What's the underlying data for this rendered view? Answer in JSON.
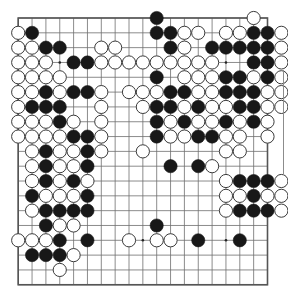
{
  "board": {
    "title": "Go game position",
    "size": 19,
    "geometry": {
      "left": 18.2,
      "top": 18.0,
      "spacing_x": 13.85,
      "spacing_y": 14.82,
      "stone_radius": 6.6,
      "border_width": 1.6,
      "line_width": 0.8
    },
    "colors": {
      "background": "#ffffff",
      "line": "#6f6f6f",
      "border": "#555555",
      "black_stone": "#181818",
      "white_stone": "#ffffff",
      "white_stone_outline": "#3a3a3a",
      "star_point": "#222222",
      "artifact_line": "#9a9a9a"
    },
    "star_points": [
      [
        3,
        3
      ],
      [
        9,
        3
      ],
      [
        15,
        3
      ],
      [
        3,
        9
      ],
      [
        9,
        9
      ],
      [
        15,
        9
      ],
      [
        3,
        15
      ],
      [
        9,
        15
      ],
      [
        15,
        15
      ]
    ],
    "column_labels": [
      "A",
      "B",
      "C",
      "D",
      "E",
      "F",
      "G",
      "H",
      "J",
      "K",
      "L",
      "M",
      "N",
      "O",
      "P",
      "Q",
      "R",
      "S",
      "T"
    ],
    "row_labels": [
      "19",
      "18",
      "17",
      "16",
      "15",
      "14",
      "13",
      "12",
      "11",
      "10",
      "9",
      "8",
      "7",
      "6",
      "5",
      "4",
      "3",
      "2",
      "1"
    ],
    "black_stones": [
      [
        11,
        0
      ],
      [
        2,
        1
      ],
      [
        11,
        1
      ],
      [
        12,
        1
      ],
      [
        18,
        1
      ],
      [
        19,
        1
      ],
      [
        3,
        2
      ],
      [
        4,
        2
      ],
      [
        12,
        2
      ],
      [
        15,
        2
      ],
      [
        16,
        2
      ],
      [
        17,
        2
      ],
      [
        18,
        2
      ],
      [
        19,
        2
      ],
      [
        5,
        3
      ],
      [
        6,
        3
      ],
      [
        18,
        3
      ],
      [
        19,
        3
      ],
      [
        11,
        4
      ],
      [
        16,
        4
      ],
      [
        17,
        4
      ],
      [
        19,
        4
      ],
      [
        3,
        5
      ],
      [
        5,
        5
      ],
      [
        6,
        5
      ],
      [
        12,
        5
      ],
      [
        13,
        5
      ],
      [
        16,
        5
      ],
      [
        17,
        5
      ],
      [
        18,
        5
      ],
      [
        2,
        6
      ],
      [
        3,
        6
      ],
      [
        4,
        6
      ],
      [
        11,
        6
      ],
      [
        12,
        6
      ],
      [
        14,
        6
      ],
      [
        17,
        6
      ],
      [
        18,
        6
      ],
      [
        4,
        7
      ],
      [
        11,
        7
      ],
      [
        13,
        7
      ],
      [
        16,
        7
      ],
      [
        18,
        7
      ],
      [
        5,
        8
      ],
      [
        6,
        8
      ],
      [
        11,
        8
      ],
      [
        14,
        8
      ],
      [
        15,
        8
      ],
      [
        3,
        9
      ],
      [
        6,
        9
      ],
      [
        3,
        10
      ],
      [
        6,
        10
      ],
      [
        12,
        10
      ],
      [
        14,
        10
      ],
      [
        3,
        11
      ],
      [
        5,
        11
      ],
      [
        17,
        11
      ],
      [
        18,
        11
      ],
      [
        19,
        11
      ],
      [
        2,
        12
      ],
      [
        6,
        12
      ],
      [
        18,
        12
      ],
      [
        3,
        13
      ],
      [
        4,
        13
      ],
      [
        5,
        13
      ],
      [
        6,
        13
      ],
      [
        17,
        13
      ],
      [
        18,
        13
      ],
      [
        19,
        13
      ],
      [
        3,
        14
      ],
      [
        11,
        14
      ],
      [
        4,
        15
      ],
      [
        6,
        15
      ],
      [
        14,
        15
      ],
      [
        17,
        15
      ],
      [
        2,
        16
      ],
      [
        3,
        16
      ],
      [
        4,
        16
      ]
    ],
    "white_stones": [
      [
        18,
        0
      ],
      [
        1,
        1
      ],
      [
        13,
        1
      ],
      [
        14,
        1
      ],
      [
        16,
        1
      ],
      [
        17,
        1
      ],
      [
        20,
        1
      ],
      [
        1,
        2
      ],
      [
        2,
        2
      ],
      [
        7,
        2
      ],
      [
        8,
        2
      ],
      [
        13,
        2
      ],
      [
        20,
        2
      ],
      [
        1,
        3
      ],
      [
        2,
        3
      ],
      [
        3,
        3
      ],
      [
        7,
        3
      ],
      [
        8,
        3
      ],
      [
        9,
        3
      ],
      [
        10,
        3
      ],
      [
        11,
        3
      ],
      [
        12,
        3
      ],
      [
        13,
        3
      ],
      [
        14,
        3
      ],
      [
        15,
        3
      ],
      [
        20,
        3
      ],
      [
        1,
        4
      ],
      [
        2,
        4
      ],
      [
        3,
        4
      ],
      [
        4,
        4
      ],
      [
        13,
        4
      ],
      [
        14,
        4
      ],
      [
        15,
        4
      ],
      [
        18,
        4
      ],
      [
        20,
        4
      ],
      [
        1,
        5
      ],
      [
        2,
        5
      ],
      [
        4,
        5
      ],
      [
        7,
        5
      ],
      [
        9,
        5
      ],
      [
        10,
        5
      ],
      [
        11,
        5
      ],
      [
        14,
        5
      ],
      [
        15,
        5
      ],
      [
        19,
        5
      ],
      [
        20,
        5
      ],
      [
        1,
        6
      ],
      [
        7,
        6
      ],
      [
        10,
        6
      ],
      [
        13,
        6
      ],
      [
        15,
        6
      ],
      [
        16,
        6
      ],
      [
        19,
        6
      ],
      [
        20,
        6
      ],
      [
        1,
        7
      ],
      [
        2,
        7
      ],
      [
        3,
        7
      ],
      [
        5,
        7
      ],
      [
        7,
        7
      ],
      [
        12,
        7
      ],
      [
        14,
        7
      ],
      [
        15,
        7
      ],
      [
        17,
        7
      ],
      [
        19,
        7
      ],
      [
        1,
        8
      ],
      [
        2,
        8
      ],
      [
        3,
        8
      ],
      [
        4,
        8
      ],
      [
        7,
        8
      ],
      [
        12,
        8
      ],
      [
        13,
        8
      ],
      [
        16,
        8
      ],
      [
        17,
        8
      ],
      [
        19,
        8
      ],
      [
        2,
        9
      ],
      [
        4,
        9
      ],
      [
        5,
        9
      ],
      [
        7,
        9
      ],
      [
        10,
        9
      ],
      [
        16,
        9
      ],
      [
        17,
        9
      ],
      [
        2,
        10
      ],
      [
        4,
        10
      ],
      [
        5,
        10
      ],
      [
        15,
        10
      ],
      [
        2,
        11
      ],
      [
        4,
        11
      ],
      [
        6,
        11
      ],
      [
        16,
        11
      ],
      [
        20,
        11
      ],
      [
        3,
        12
      ],
      [
        4,
        12
      ],
      [
        5,
        12
      ],
      [
        16,
        12
      ],
      [
        17,
        12
      ],
      [
        19,
        12
      ],
      [
        20,
        12
      ],
      [
        2,
        13
      ],
      [
        16,
        13
      ],
      [
        20,
        13
      ],
      [
        4,
        14
      ],
      [
        5,
        14
      ],
      [
        1,
        15
      ],
      [
        2,
        15
      ],
      [
        3,
        15
      ],
      [
        9,
        15
      ],
      [
        11,
        15
      ],
      [
        12,
        15
      ],
      [
        5,
        16
      ],
      [
        4,
        17
      ]
    ],
    "stats": {
      "black_label": "Black",
      "white_label": "White"
    }
  }
}
